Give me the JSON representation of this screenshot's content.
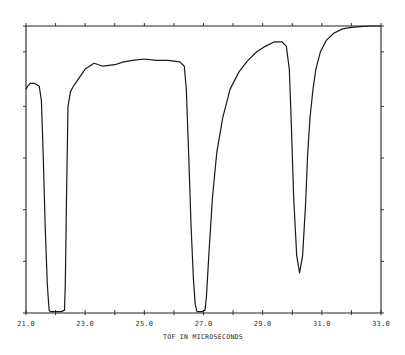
{
  "chart_data": {
    "type": "line",
    "title": "",
    "xlabel": "TOF IN MICROSECONDS",
    "ylabel": "",
    "xlim": [
      21.0,
      33.0
    ],
    "ylim": [
      0.0,
      1.0
    ],
    "x_ticks_major": [
      21.0,
      23.0,
      25.0,
      27.0,
      29.0,
      31.0,
      33.0
    ],
    "x_tick_labels": [
      "21.0",
      "23.0",
      "25.0",
      "27.0",
      "29.0",
      "31.0",
      "33.0"
    ],
    "x_ticks_minor_step": 1.0,
    "y_ticks": [
      0.0,
      0.18,
      0.36,
      0.54,
      0.72,
      0.91,
      1.0
    ],
    "y_tick_labels": [],
    "grid": false,
    "legend": null,
    "series": [
      {
        "name": "transmission",
        "x": [
          21.0,
          21.05,
          21.15,
          21.3,
          21.45,
          21.52,
          21.58,
          21.65,
          21.72,
          21.78,
          21.82,
          21.9,
          22.0,
          22.1,
          22.2,
          22.3,
          22.33,
          22.37,
          22.42,
          22.5,
          22.6,
          22.8,
          23.0,
          23.3,
          23.6,
          24.0,
          24.3,
          24.6,
          25.0,
          25.4,
          25.8,
          26.2,
          26.35,
          26.42,
          26.5,
          26.58,
          26.66,
          26.72,
          26.78,
          26.85,
          26.95,
          27.05,
          27.1,
          27.18,
          27.3,
          27.45,
          27.65,
          27.9,
          28.2,
          28.5,
          28.8,
          29.1,
          29.4,
          29.65,
          29.8,
          29.9,
          29.97,
          30.05,
          30.15,
          30.25,
          30.35,
          30.45,
          30.52,
          30.6,
          30.7,
          30.8,
          30.95,
          31.15,
          31.4,
          31.7,
          32.0,
          32.3,
          32.6,
          33.0
        ],
        "y": [
          0.78,
          0.79,
          0.8,
          0.8,
          0.79,
          0.74,
          0.55,
          0.3,
          0.1,
          0.01,
          0.005,
          0.005,
          0.005,
          0.005,
          0.005,
          0.01,
          0.1,
          0.4,
          0.72,
          0.77,
          0.79,
          0.82,
          0.85,
          0.87,
          0.86,
          0.865,
          0.875,
          0.88,
          0.885,
          0.88,
          0.88,
          0.875,
          0.86,
          0.78,
          0.55,
          0.3,
          0.12,
          0.03,
          0.005,
          0.005,
          0.005,
          0.01,
          0.06,
          0.2,
          0.4,
          0.56,
          0.68,
          0.78,
          0.84,
          0.88,
          0.91,
          0.93,
          0.945,
          0.945,
          0.93,
          0.85,
          0.65,
          0.4,
          0.2,
          0.14,
          0.2,
          0.38,
          0.55,
          0.68,
          0.78,
          0.85,
          0.91,
          0.95,
          0.975,
          0.99,
          0.995,
          0.998,
          1.0,
          1.0
        ]
      }
    ]
  }
}
